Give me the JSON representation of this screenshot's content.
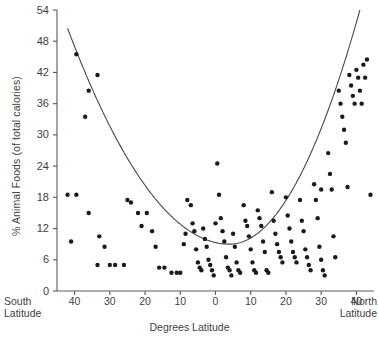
{
  "chart": {
    "type": "scatter",
    "title": "",
    "xlabel": "Degrees Latitude",
    "ylabel": "% Animal Foods (of total calories)"
  },
  "axes": {
    "y_ticks": [
      "54",
      "48",
      "42",
      "36",
      "30",
      "24",
      "18",
      "12",
      "6",
      "0"
    ],
    "x_ticks": [
      "40",
      "30",
      "20",
      "10",
      "0",
      "10",
      "20",
      "30",
      "40"
    ],
    "left_corner_line1": "South",
    "left_corner_line2": "Latitude",
    "right_corner_line1": "North",
    "right_corner_line2": "Latitude"
  },
  "chart_data": {
    "type": "scatter",
    "title": "",
    "xlabel": "Degrees Latitude",
    "ylabel": "% Animal Foods (of total calories)",
    "xlim": [
      -45,
      45
    ],
    "ylim": [
      0,
      54
    ],
    "ytick_values": [
      0,
      6,
      12,
      18,
      24,
      30,
      36,
      42,
      48,
      54
    ],
    "xtick_values": [
      -40,
      -30,
      -20,
      -10,
      0,
      10,
      20,
      30,
      40
    ],
    "xtick_labels": [
      "40",
      "30",
      "20",
      "10",
      "0",
      "10",
      "20",
      "30",
      "40"
    ],
    "x_axis_note": "Negative values are degrees South latitude, positive values are degrees North latitude",
    "grid": false,
    "legend": false,
    "marker_color": "#1a1a1a",
    "curve_color": "#4a4a4a",
    "fit_curve": {
      "type": "parabola",
      "description": "U-shaped quadratic fit, minimum near 4 degrees North at about 9 percent",
      "vertex_x": 4,
      "vertex_y": 9,
      "left_endpoint": [
        -42,
        50.5
      ],
      "right_endpoint": [
        41,
        54
      ]
    },
    "points": [
      [
        -39.5,
        45.5
      ],
      [
        -36.0,
        38.5
      ],
      [
        -33.5,
        41.5
      ],
      [
        -37.0,
        33.5
      ],
      [
        -42.0,
        18.5
      ],
      [
        -39.5,
        18.5
      ],
      [
        -36.0,
        15.0
      ],
      [
        -33.0,
        10.5
      ],
      [
        -31.5,
        8.5
      ],
      [
        -33.5,
        5.0
      ],
      [
        -30.0,
        5.0
      ],
      [
        -28.5,
        5.0
      ],
      [
        -26.0,
        5.0
      ],
      [
        -25.0,
        17.5
      ],
      [
        -24.0,
        17.0
      ],
      [
        -22.0,
        15.0
      ],
      [
        -21.0,
        12.5
      ],
      [
        -19.5,
        15.0
      ],
      [
        -18.0,
        11.5
      ],
      [
        -17.0,
        8.5
      ],
      [
        -16.0,
        4.5
      ],
      [
        -14.5,
        4.5
      ],
      [
        -12.5,
        3.5
      ],
      [
        -11.0,
        3.5
      ],
      [
        -10.0,
        3.5
      ],
      [
        -9.0,
        9.0
      ],
      [
        -8.5,
        11.0
      ],
      [
        -8.0,
        17.5
      ],
      [
        -7.0,
        16.5
      ],
      [
        -6.5,
        13.0
      ],
      [
        -6.0,
        11.5
      ],
      [
        -5.5,
        8.0
      ],
      [
        -5.0,
        5.5
      ],
      [
        -4.5,
        4.5
      ],
      [
        -4.0,
        4.0
      ],
      [
        -3.5,
        12.0
      ],
      [
        -3.0,
        10.0
      ],
      [
        -2.5,
        8.5
      ],
      [
        -2.0,
        6.0
      ],
      [
        -1.5,
        5.0
      ],
      [
        -1.0,
        4.0
      ],
      [
        -0.5,
        3.0
      ],
      [
        0.0,
        13.0
      ],
      [
        0.5,
        24.5
      ],
      [
        1.0,
        18.5
      ],
      [
        1.5,
        14.0
      ],
      [
        2.0,
        11.5
      ],
      [
        2.5,
        9.5
      ],
      [
        3.0,
        6.5
      ],
      [
        3.5,
        4.5
      ],
      [
        4.0,
        4.0
      ],
      [
        4.5,
        3.0
      ],
      [
        5.0,
        11.0
      ],
      [
        5.5,
        8.5
      ],
      [
        6.0,
        5.5
      ],
      [
        6.5,
        4.0
      ],
      [
        7.0,
        3.5
      ],
      [
        8.0,
        16.5
      ],
      [
        8.5,
        13.5
      ],
      [
        9.0,
        12.5
      ],
      [
        9.5,
        10.5
      ],
      [
        10.0,
        8.0
      ],
      [
        10.5,
        5.5
      ],
      [
        11.0,
        4.0
      ],
      [
        11.5,
        3.5
      ],
      [
        12.0,
        15.5
      ],
      [
        12.5,
        14.0
      ],
      [
        13.0,
        12.5
      ],
      [
        13.5,
        9.5
      ],
      [
        14.0,
        7.5
      ],
      [
        14.5,
        4.0
      ],
      [
        15.0,
        3.5
      ],
      [
        16.0,
        19.0
      ],
      [
        16.5,
        13.5
      ],
      [
        17.0,
        11.0
      ],
      [
        17.5,
        9.0
      ],
      [
        18.0,
        7.5
      ],
      [
        18.5,
        6.5
      ],
      [
        19.0,
        5.5
      ],
      [
        20.0,
        18.0
      ],
      [
        20.5,
        14.5
      ],
      [
        21.0,
        12.0
      ],
      [
        21.5,
        9.5
      ],
      [
        22.0,
        7.5
      ],
      [
        22.5,
        6.5
      ],
      [
        23.0,
        5.5
      ],
      [
        24.0,
        17.5
      ],
      [
        24.5,
        13.5
      ],
      [
        25.0,
        11.5
      ],
      [
        25.5,
        8.0
      ],
      [
        26.0,
        6.5
      ],
      [
        26.5,
        5.0
      ],
      [
        27.0,
        4.0
      ],
      [
        28.0,
        20.5
      ],
      [
        28.5,
        17.5
      ],
      [
        29.0,
        14.0
      ],
      [
        29.5,
        8.5
      ],
      [
        30.0,
        6.0
      ],
      [
        30.5,
        4.0
      ],
      [
        31.0,
        3.0
      ],
      [
        32.0,
        26.5
      ],
      [
        32.5,
        22.5
      ],
      [
        33.0,
        19.5
      ],
      [
        33.5,
        10.5
      ],
      [
        34.0,
        6.5
      ],
      [
        35.0,
        38.5
      ],
      [
        35.5,
        36.0
      ],
      [
        36.0,
        33.5
      ],
      [
        36.5,
        31.0
      ],
      [
        37.0,
        28.5
      ],
      [
        37.5,
        20.0
      ],
      [
        38.0,
        41.5
      ],
      [
        38.5,
        39.5
      ],
      [
        39.0,
        37.5
      ],
      [
        39.5,
        36.0
      ],
      [
        40.0,
        42.5
      ],
      [
        40.5,
        41.0
      ],
      [
        41.0,
        38.5
      ],
      [
        41.5,
        36.0
      ],
      [
        42.0,
        43.5
      ],
      [
        42.5,
        41.0
      ],
      [
        43.0,
        44.5
      ],
      [
        44.0,
        18.5
      ],
      [
        30.0,
        19.5
      ],
      [
        -41.0,
        9.5
      ]
    ]
  }
}
